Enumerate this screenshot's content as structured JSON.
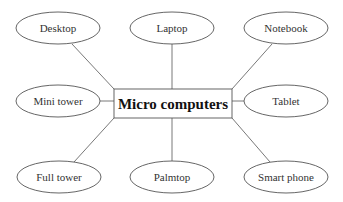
{
  "diagram": {
    "type": "mind-map",
    "center": {
      "label": "Micro computers",
      "x": 114,
      "y": 89,
      "w": 118,
      "h": 29
    },
    "nodes": [
      {
        "id": "desktop",
        "label": "Desktop",
        "cx": 58,
        "cy": 28,
        "ax": 72,
        "ay": 44,
        "bx": 114,
        "by": 89
      },
      {
        "id": "laptop",
        "label": "Laptop",
        "cx": 172,
        "cy": 28,
        "ax": 172,
        "ay": 44,
        "bx": 172,
        "by": 89
      },
      {
        "id": "notebook",
        "label": "Notebook",
        "cx": 286,
        "cy": 28,
        "ax": 272,
        "ay": 44,
        "bx": 232,
        "by": 89
      },
      {
        "id": "mini-tower",
        "label": "Mini tower",
        "cx": 58,
        "cy": 101,
        "ax": 100,
        "ay": 101,
        "bx": 114,
        "by": 101
      },
      {
        "id": "tablet",
        "label": "Tablet",
        "cx": 286,
        "cy": 101,
        "ax": 244,
        "ay": 101,
        "bx": 232,
        "by": 101
      },
      {
        "id": "full-tower",
        "label": "Full tower",
        "cx": 59,
        "cy": 177,
        "ax": 74,
        "ay": 162,
        "bx": 114,
        "by": 118
      },
      {
        "id": "palmtop",
        "label": "Palmtop",
        "cx": 172,
        "cy": 177,
        "ax": 172,
        "ay": 161,
        "bx": 172,
        "by": 118
      },
      {
        "id": "smart-phone",
        "label": "Smart phone",
        "cx": 286,
        "cy": 177,
        "ax": 270,
        "ay": 162,
        "bx": 232,
        "by": 118
      }
    ],
    "node_rx": 42,
    "node_ry": 16
  }
}
